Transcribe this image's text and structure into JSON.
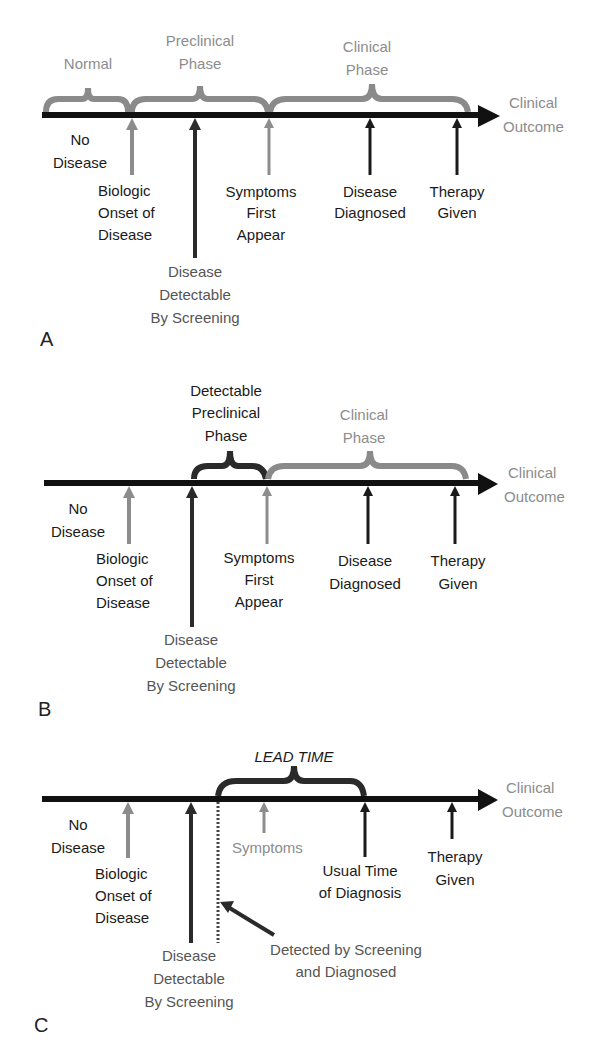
{
  "colors": {
    "axis": "#111111",
    "gray_arrow": "#8c8c8c",
    "black_arrow": "#1a1a1a",
    "gray_text": "#8c8c8c",
    "gray_brace": "#8a8a8a",
    "dark_brace": "#2a2a2a"
  },
  "panelA": {
    "letter": "A",
    "braces": {
      "normal": "Normal",
      "preclinical_1": "Preclinical",
      "preclinical_2": "Phase",
      "clinical_1": "Clinical",
      "clinical_2": "Phase"
    },
    "outcome_1": "Clinical",
    "outcome_2": "Outcome",
    "no_disease_1": "No",
    "no_disease_2": "Disease",
    "onset": [
      "Biologic",
      "Onset of",
      "Disease"
    ],
    "symptoms": [
      "Symptoms",
      "First",
      "Appear"
    ],
    "diagnosed": [
      "Disease",
      "Diagnosed"
    ],
    "therapy": [
      "Therapy",
      "Given"
    ],
    "detectable": [
      "Disease",
      "Detectable",
      "By Screening"
    ]
  },
  "panelB": {
    "letter": "B",
    "braces": {
      "detectable_1": "Detectable",
      "detectable_2": "Preclinical",
      "detectable_3": "Phase",
      "clinical_1": "Clinical",
      "clinical_2": "Phase"
    },
    "outcome_1": "Clinical",
    "outcome_2": "Outcome",
    "no_disease_1": "No",
    "no_disease_2": "Disease",
    "onset": [
      "Biologic",
      "Onset of",
      "Disease"
    ],
    "symptoms": [
      "Symptoms",
      "First",
      "Appear"
    ],
    "diagnosed": [
      "Disease",
      "Diagnosed"
    ],
    "therapy": [
      "Therapy",
      "Given"
    ],
    "detectable": [
      "Disease",
      "Detectable",
      "By Screening"
    ]
  },
  "panelC": {
    "letter": "C",
    "lead_time": "LEAD TIME",
    "outcome_1": "Clinical",
    "outcome_2": "Outcome",
    "no_disease_1": "No",
    "no_disease_2": "Disease",
    "symptoms": "Symptoms",
    "onset": [
      "Biologic",
      "Onset of",
      "Disease"
    ],
    "usual_time": [
      "Usual Time",
      "of Diagnosis"
    ],
    "therapy": [
      "Therapy",
      "Given"
    ],
    "detectable": [
      "Disease",
      "Detectable",
      "By Screening"
    ],
    "screened": [
      "Detected by Screening",
      "and Diagnosed"
    ]
  }
}
